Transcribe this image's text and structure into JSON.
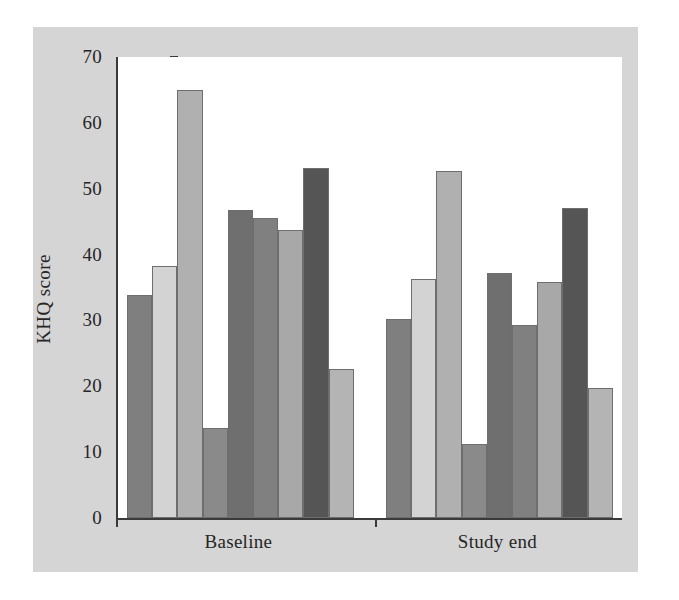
{
  "figure": {
    "background_color": "#ffffff",
    "panel_color": "#d5d5d5",
    "plot_background_color": "#ffffff",
    "axis_color": "#3a3a3a"
  },
  "chart_data": {
    "type": "bar",
    "title": "",
    "subtitle": "",
    "xlabel": "",
    "ylabel": "KHQ score",
    "ylim": [
      0,
      70
    ],
    "yticks": [
      0,
      10,
      20,
      30,
      40,
      50,
      60,
      70
    ],
    "ytick_labels": [
      "0",
      "10",
      "20",
      "30",
      "40",
      "50",
      "60",
      "70"
    ],
    "grid": false,
    "legend": "none",
    "categories": [
      "Baseline",
      "Study end"
    ],
    "series": [
      {
        "name": "domain-1",
        "color": "#7f7f7f",
        "values": [
          33.8,
          30.2
        ]
      },
      {
        "name": "domain-2",
        "color": "#d3d3d3",
        "values": [
          38.3,
          36.3
        ]
      },
      {
        "name": "domain-3",
        "color": "#b0b0b0",
        "values": [
          65.0,
          52.7
        ]
      },
      {
        "name": "domain-4",
        "color": "#8a8a8a",
        "values": [
          13.7,
          11.3
        ]
      },
      {
        "name": "domain-5",
        "color": "#6f6f6f",
        "values": [
          46.8,
          37.2
        ]
      },
      {
        "name": "domain-6",
        "color": "#808080",
        "values": [
          45.5,
          29.3
        ]
      },
      {
        "name": "domain-7",
        "color": "#a8a8a8",
        "values": [
          43.7,
          35.8
        ]
      },
      {
        "name": "domain-8",
        "color": "#555555",
        "values": [
          53.2,
          47.0
        ]
      },
      {
        "name": "domain-9",
        "color": "#b4b4b4",
        "values": [
          22.7,
          19.8
        ]
      }
    ]
  },
  "axis": {
    "y_title": "KHQ score",
    "x_group_labels": [
      "Baseline",
      "Study end"
    ]
  }
}
